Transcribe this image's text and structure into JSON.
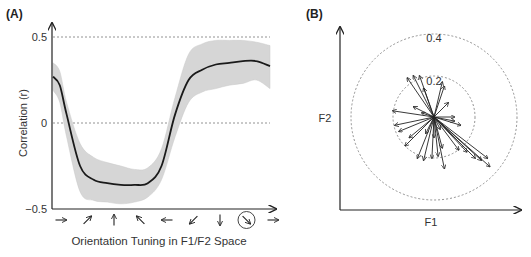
{
  "chart_data": [
    {
      "panel": "(A)",
      "type": "line",
      "title": "",
      "xlabel": "Orientation Tuning in F1/F2 Space",
      "ylabel": "Correlation (r)",
      "ylim": [
        -0.5,
        0.5
      ],
      "yticks": [
        "0.5",
        "0",
        "−0.5"
      ],
      "xtick_glyphs": [
        "→",
        "↗",
        "↑",
        "↖",
        "←",
        "↙",
        "↓",
        "↘",
        "→"
      ],
      "highlighted_tick": "↘",
      "reference_lines": [
        0.5,
        0
      ],
      "grid": false,
      "x": [
        0,
        0.25,
        0.5,
        1,
        1.5,
        2,
        2.5,
        3,
        3.5,
        4,
        4.5,
        5,
        5.5,
        6,
        6.5,
        7,
        7.5,
        8
      ],
      "series": [
        {
          "name": "mean",
          "values": [
            0.27,
            0.22,
            0.05,
            -0.25,
            -0.33,
            -0.35,
            -0.36,
            -0.36,
            -0.35,
            -0.25,
            0.05,
            0.25,
            0.31,
            0.34,
            0.35,
            0.36,
            0.36,
            0.33
          ]
        },
        {
          "name": "upper",
          "values": [
            0.35,
            0.3,
            0.12,
            -0.12,
            -0.2,
            -0.23,
            -0.25,
            -0.27,
            -0.26,
            -0.15,
            0.15,
            0.4,
            0.46,
            0.48,
            0.48,
            0.48,
            0.47,
            0.45
          ]
        },
        {
          "name": "lower",
          "values": [
            0.19,
            0.12,
            -0.08,
            -0.4,
            -0.45,
            -0.46,
            -0.47,
            -0.46,
            -0.43,
            -0.33,
            -0.08,
            0.12,
            0.18,
            0.2,
            0.22,
            0.23,
            0.25,
            0.2
          ]
        }
      ]
    },
    {
      "panel": "(B)",
      "type": "scatter",
      "title": "",
      "xlabel": "F1",
      "ylabel": "F2",
      "circle_labels": [
        "0.4",
        "0.2"
      ],
      "circles": [
        0.4,
        0.2
      ],
      "note": "vectors from common origin; length = correlation magnitude",
      "vectors": [
        [
          -0.13,
          0.19
        ],
        [
          -0.1,
          0.2
        ],
        [
          -0.07,
          0.2
        ],
        [
          -0.05,
          0.14
        ],
        [
          0.04,
          0.17
        ],
        [
          0.05,
          0.15
        ],
        [
          0.07,
          0.07
        ],
        [
          -0.2,
          0.03
        ],
        [
          -0.1,
          0.05
        ],
        [
          -0.06,
          0.02
        ],
        [
          0.1,
          0.0
        ],
        [
          0.13,
          -0.04
        ],
        [
          0.1,
          -0.02
        ],
        [
          -0.19,
          -0.04
        ],
        [
          -0.17,
          -0.07
        ],
        [
          -0.12,
          -0.1
        ],
        [
          -0.14,
          -0.14
        ],
        [
          -0.08,
          -0.2
        ],
        [
          -0.05,
          -0.21
        ],
        [
          -0.01,
          -0.2
        ],
        [
          0.02,
          -0.19
        ],
        [
          0.05,
          -0.25
        ],
        [
          0.04,
          -0.15
        ],
        [
          0.12,
          -0.16
        ],
        [
          0.16,
          -0.17
        ],
        [
          0.2,
          -0.2
        ],
        [
          0.23,
          -0.21
        ],
        [
          0.27,
          -0.24
        ],
        [
          0.26,
          -0.2
        ],
        [
          -0.04,
          -0.08
        ],
        [
          0.0,
          -0.1
        ],
        [
          0.03,
          -0.06
        ]
      ]
    }
  ],
  "panelA": {
    "tag": "(A)",
    "ylabel": "Correlation (r)",
    "xlabel": "Orientation Tuning in F1/F2 Space",
    "y_ticks": {
      "top": "0.5",
      "mid": "0",
      "bottom": "−0.5"
    }
  },
  "panelB": {
    "tag": "(B)",
    "xlabel": "F1",
    "ylabel": "F2",
    "outer_ring": "0.4",
    "inner_ring": "0.2"
  },
  "colors": {
    "line": "#1a1a1a",
    "band": "#d6d6d6",
    "axis": "#222222",
    "dashed": "#777777"
  }
}
